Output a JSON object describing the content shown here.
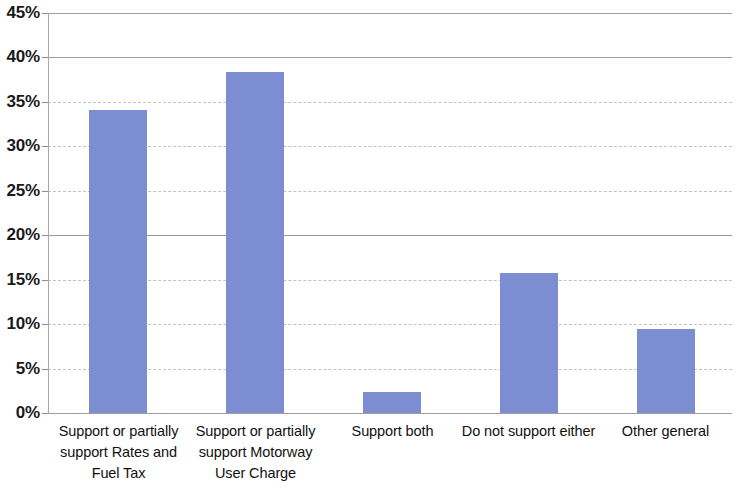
{
  "chart_data": {
    "type": "bar",
    "title": "",
    "subtitle": "",
    "xlabel": "",
    "ylabel": "",
    "categories": [
      "Support or partially support Rates and Fuel Tax",
      "Support or partially support Motorway User Charge",
      "Support both",
      "Do not support either",
      "Other general"
    ],
    "category_lines": [
      [
        "Support or partially",
        "support Rates and",
        "Fuel Tax"
      ],
      [
        "Support or partially",
        "support Motorway",
        "User Charge"
      ],
      [
        "Support both"
      ],
      [
        "Do not support either"
      ],
      [
        "Other general"
      ]
    ],
    "values": [
      34.1,
      38.4,
      2.4,
      15.8,
      9.5
    ],
    "value_labels": [
      "34.1%",
      "38.4%",
      "2.4%",
      "15.8%",
      "9.5%"
    ],
    "ylim": [
      0,
      45
    ],
    "ytick_step": 5,
    "ytick_labels": [
      "45%",
      "40%",
      "35%",
      "30%",
      "25%",
      "20%",
      "15%",
      "10%",
      "5%",
      "0%"
    ],
    "ytick_values": [
      45,
      40,
      35,
      30,
      25,
      20,
      15,
      10,
      5,
      0
    ],
    "grid": true,
    "grid_axis": "y",
    "legend": false,
    "legend_position": "none",
    "series": [
      {
        "name": "Share of respondents",
        "values": [
          34.1,
          38.4,
          2.4,
          15.8,
          9.5
        ]
      }
    ],
    "colors": {
      "bar": "#7c8dd2",
      "grid": "#c2c2c2",
      "axis": "#9d9d9d",
      "text": "#111111",
      "background": "#ffffff"
    }
  }
}
